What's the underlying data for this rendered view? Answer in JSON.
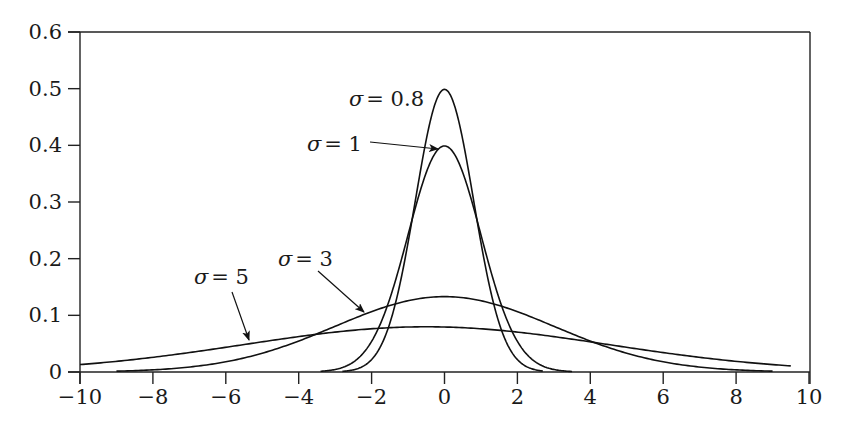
{
  "chart_data": {
    "type": "line",
    "title": "",
    "xlabel": "",
    "ylabel": "",
    "xlim": [
      -10,
      10
    ],
    "ylim": [
      0,
      0.6
    ],
    "grid": false,
    "legend": "none (inline annotations with arrows)",
    "x_ticks": [
      "−10",
      "−8",
      "−6",
      "−4",
      "−2",
      "0",
      "2",
      "4",
      "6",
      "8",
      "10"
    ],
    "x_tick_values": [
      -10,
      -8,
      -6,
      -4,
      -2,
      0,
      2,
      4,
      6,
      8,
      10
    ],
    "y_ticks": [
      "0",
      "0.1",
      "0.2",
      "0.3",
      "0.4",
      "0.5",
      "0.6"
    ],
    "y_tick_values": [
      0,
      0.1,
      0.2,
      0.3,
      0.4,
      0.5,
      0.6
    ],
    "series": [
      {
        "name": "σ = 0.8",
        "sigma": 0.8,
        "mu": 0,
        "peak": 0.5,
        "x_range": [
          -2.8,
          2.7
        ]
      },
      {
        "name": "σ = 1",
        "sigma": 1,
        "mu": 0,
        "peak": 0.4,
        "x_range": [
          -3.4,
          3.5
        ]
      },
      {
        "name": "σ = 3",
        "sigma": 3,
        "mu": 0,
        "peak": 0.133,
        "x_range": [
          -9,
          9
        ]
      },
      {
        "name": "σ = 5",
        "sigma": 5,
        "mu": -0.5,
        "peak": 0.08,
        "x_range": [
          -10,
          9.5
        ]
      }
    ],
    "annotations": [
      {
        "text_sigma": "σ",
        "text_value": "= 0.8",
        "label_xy": [
          349,
          106
        ],
        "arrow": null
      },
      {
        "text_sigma": "σ",
        "text_value": "= 1",
        "label_xy": [
          307,
          151
        ],
        "arrow": [
          [
            370,
            142
          ],
          [
            438,
            149
          ]
        ]
      },
      {
        "text_sigma": "σ",
        "text_value": "= 3",
        "label_xy": [
          278,
          266
        ],
        "arrow": [
          [
            318,
            271
          ],
          [
            364,
            312
          ]
        ]
      },
      {
        "text_sigma": "σ",
        "text_value": "= 5",
        "label_xy": [
          194,
          284
        ],
        "arrow": [
          [
            232,
            292
          ],
          [
            249,
            340
          ]
        ]
      }
    ]
  }
}
